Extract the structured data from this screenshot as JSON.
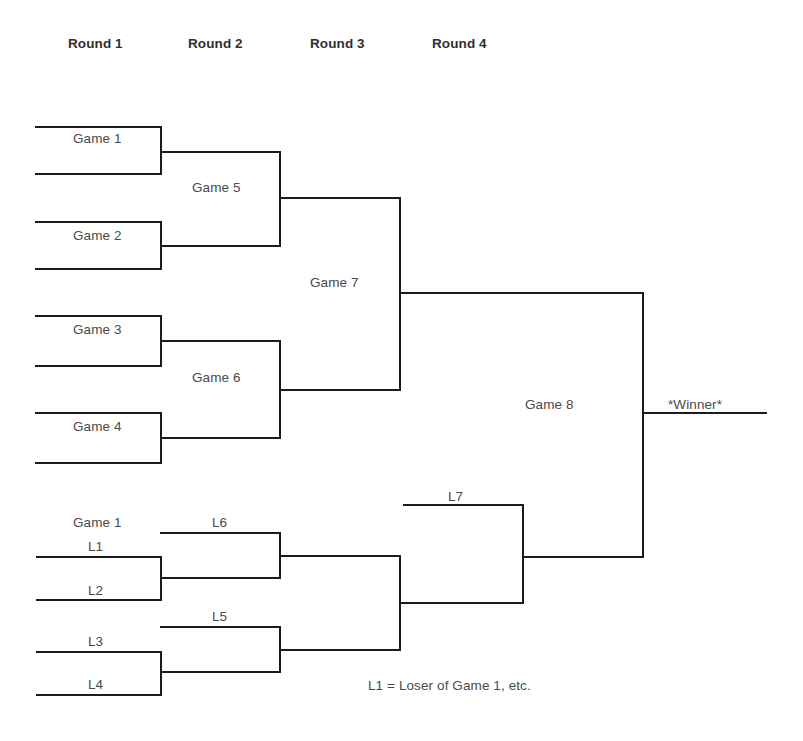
{
  "diagram": {
    "line_color": "#1b1b1b",
    "text_color": "#4a4a4a",
    "background": "#ffffff"
  },
  "round_headers": [
    {
      "label": "Round 1",
      "x": 68,
      "y": 36
    },
    {
      "label": "Round 2",
      "x": 188,
      "y": 36
    },
    {
      "label": "Round 3",
      "x": 310,
      "y": 36
    },
    {
      "label": "Round 4",
      "x": 432,
      "y": 36
    }
  ],
  "winners_bracket": {
    "labels": [
      {
        "name": "game-1",
        "text": "Game 1",
        "x": 73,
        "y": 131
      },
      {
        "name": "game-2",
        "text": "Game 2",
        "x": 73,
        "y": 228
      },
      {
        "name": "game-3",
        "text": "Game 3",
        "x": 73,
        "y": 322
      },
      {
        "name": "game-4",
        "text": "Game 4",
        "x": 73,
        "y": 419
      },
      {
        "name": "game-5",
        "text": "Game 5",
        "x": 192,
        "y": 180
      },
      {
        "name": "game-6",
        "text": "Game 6",
        "x": 192,
        "y": 370
      },
      {
        "name": "game-7",
        "text": "Game 7",
        "x": 310,
        "y": 275
      },
      {
        "name": "game-8",
        "text": "Game 8",
        "x": 525,
        "y": 397
      },
      {
        "name": "winner",
        "text": "*Winner*",
        "x": 668,
        "y": 397
      }
    ],
    "lines": [
      {
        "name": "game-1-top",
        "x1": 36,
        "y1": 127,
        "x2": 161,
        "y2": 127
      },
      {
        "name": "game-1-bottom",
        "x1": 36,
        "y1": 174,
        "x2": 161,
        "y2": 174
      },
      {
        "name": "game-1-connector",
        "x1": 161,
        "y1": 127,
        "x2": 161,
        "y2": 174
      },
      {
        "name": "game-2-top",
        "x1": 36,
        "y1": 222,
        "x2": 161,
        "y2": 222
      },
      {
        "name": "game-2-bottom",
        "x1": 36,
        "y1": 269,
        "x2": 161,
        "y2": 269
      },
      {
        "name": "game-2-connector",
        "x1": 161,
        "y1": 222,
        "x2": 161,
        "y2": 269
      },
      {
        "name": "game-3-top",
        "x1": 36,
        "y1": 316,
        "x2": 161,
        "y2": 316
      },
      {
        "name": "game-3-bottom",
        "x1": 36,
        "y1": 366,
        "x2": 161,
        "y2": 366
      },
      {
        "name": "game-3-connector",
        "x1": 161,
        "y1": 316,
        "x2": 161,
        "y2": 366
      },
      {
        "name": "game-4-top",
        "x1": 36,
        "y1": 413,
        "x2": 161,
        "y2": 413
      },
      {
        "name": "game-4-bottom",
        "x1": 36,
        "y1": 463,
        "x2": 161,
        "y2": 463
      },
      {
        "name": "game-4-connector",
        "x1": 161,
        "y1": 413,
        "x2": 161,
        "y2": 463
      },
      {
        "name": "game-5-top",
        "x1": 161,
        "y1": 152,
        "x2": 280,
        "y2": 152
      },
      {
        "name": "game-5-bottom",
        "x1": 161,
        "y1": 246,
        "x2": 280,
        "y2": 246
      },
      {
        "name": "game-5-connector",
        "x1": 280,
        "y1": 152,
        "x2": 280,
        "y2": 246
      },
      {
        "name": "game-6-top",
        "x1": 161,
        "y1": 341,
        "x2": 280,
        "y2": 341
      },
      {
        "name": "game-6-bottom",
        "x1": 161,
        "y1": 438,
        "x2": 280,
        "y2": 438
      },
      {
        "name": "game-6-connector",
        "x1": 280,
        "y1": 341,
        "x2": 280,
        "y2": 438
      },
      {
        "name": "game-7-top",
        "x1": 280,
        "y1": 198,
        "x2": 400,
        "y2": 198
      },
      {
        "name": "game-7-bottom",
        "x1": 280,
        "y1": 390,
        "x2": 400,
        "y2": 390
      },
      {
        "name": "game-7-connector",
        "x1": 400,
        "y1": 198,
        "x2": 400,
        "y2": 390
      },
      {
        "name": "game-8-top",
        "x1": 400,
        "y1": 293,
        "x2": 643,
        "y2": 293
      },
      {
        "name": "game-8-bottom",
        "x1": 523,
        "y1": 557,
        "x2": 643,
        "y2": 557
      },
      {
        "name": "game-8-connector",
        "x1": 643,
        "y1": 293,
        "x2": 643,
        "y2": 557
      },
      {
        "name": "winner-line",
        "x1": 643,
        "y1": 413,
        "x2": 766,
        "y2": 413
      }
    ]
  },
  "losers_bracket": {
    "labels": [
      {
        "name": "losers-game-1",
        "text": "Game 1",
        "x": 73,
        "y": 515
      },
      {
        "name": "l1",
        "text": "L1",
        "x": 88,
        "y": 539
      },
      {
        "name": "l2",
        "text": "L2",
        "x": 88,
        "y": 583
      },
      {
        "name": "l3",
        "text": "L3",
        "x": 88,
        "y": 634
      },
      {
        "name": "l4",
        "text": "L4",
        "x": 88,
        "y": 677
      },
      {
        "name": "l5",
        "text": "L5",
        "x": 212,
        "y": 609
      },
      {
        "name": "l6",
        "text": "L6",
        "x": 212,
        "y": 515
      },
      {
        "name": "l7",
        "text": "L7",
        "x": 448,
        "y": 489
      }
    ],
    "lines": [
      {
        "name": "l1-line",
        "x1": 37,
        "y1": 557,
        "x2": 161,
        "y2": 557
      },
      {
        "name": "l2-line",
        "x1": 37,
        "y1": 600,
        "x2": 161,
        "y2": 600
      },
      {
        "name": "l1-l2-connector",
        "x1": 161,
        "y1": 557,
        "x2": 161,
        "y2": 600
      },
      {
        "name": "l3-line",
        "x1": 37,
        "y1": 652,
        "x2": 161,
        "y2": 652
      },
      {
        "name": "l4-line",
        "x1": 37,
        "y1": 695,
        "x2": 161,
        "y2": 695
      },
      {
        "name": "l3-l4-connector",
        "x1": 161,
        "y1": 652,
        "x2": 161,
        "y2": 695
      },
      {
        "name": "l6-line",
        "x1": 161,
        "y1": 533,
        "x2": 280,
        "y2": 533
      },
      {
        "name": "l6-bottom",
        "x1": 161,
        "y1": 578,
        "x2": 280,
        "y2": 578
      },
      {
        "name": "l6-connector",
        "x1": 280,
        "y1": 533,
        "x2": 280,
        "y2": 578
      },
      {
        "name": "l5-line",
        "x1": 161,
        "y1": 627,
        "x2": 280,
        "y2": 627
      },
      {
        "name": "l5-bottom",
        "x1": 161,
        "y1": 672,
        "x2": 280,
        "y2": 672
      },
      {
        "name": "l5-connector",
        "x1": 280,
        "y1": 627,
        "x2": 280,
        "y2": 672
      },
      {
        "name": "l6-winner-line",
        "x1": 280,
        "y1": 556,
        "x2": 400,
        "y2": 556
      },
      {
        "name": "l5-winner-line",
        "x1": 280,
        "y1": 650,
        "x2": 400,
        "y2": 650
      },
      {
        "name": "l5-l6-connector",
        "x1": 400,
        "y1": 556,
        "x2": 400,
        "y2": 650
      },
      {
        "name": "l7-top",
        "x1": 404,
        "y1": 505,
        "x2": 523,
        "y2": 505
      },
      {
        "name": "l7-bottom",
        "x1": 400,
        "y1": 603,
        "x2": 523,
        "y2": 603
      },
      {
        "name": "l7-connector",
        "x1": 523,
        "y1": 505,
        "x2": 523,
        "y2": 603
      }
    ]
  },
  "footnote": {
    "text": "L1 = Loser of Game 1, etc.",
    "x": 368,
    "y": 678
  }
}
